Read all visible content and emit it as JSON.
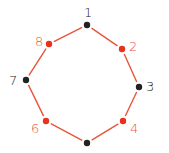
{
  "diagram": {
    "shape": "octagon-ring",
    "edge_color": "#e8553a",
    "nodes": [
      {
        "label": "1",
        "x": 87,
        "y": 25,
        "color": "#222222",
        "label_color": "#222222",
        "lx": 84,
        "ly": 6
      },
      {
        "label": "2",
        "x": 122,
        "y": 49,
        "color": "#e8321a",
        "label_color": "#e8553a",
        "lx": 129,
        "ly": 40
      },
      {
        "label": "3",
        "x": 139,
        "y": 87,
        "color": "#222222",
        "label_color": "#222222",
        "lx": 146,
        "ly": 80
      },
      {
        "label": "4",
        "x": 123,
        "y": 121,
        "color": "#e8321a",
        "label_color": "#e8553a",
        "lx": 130,
        "ly": 122
      },
      {
        "label": "",
        "x": 87,
        "y": 143,
        "color": "#222222",
        "label_color": "#222222",
        "lx": 0,
        "ly": 0
      },
      {
        "label": "6",
        "x": 46,
        "y": 121,
        "color": "#e8321a",
        "label_color": "#e8553a",
        "lx": 31,
        "ly": 122
      },
      {
        "label": "7",
        "x": 26,
        "y": 80,
        "color": "#222222",
        "label_color": "#222222",
        "lx": 9,
        "ly": 74
      },
      {
        "label": "8",
        "x": 49,
        "y": 44,
        "color": "#e8321a",
        "label_color": "#e8553a",
        "lx": 35,
        "ly": 35
      }
    ]
  }
}
